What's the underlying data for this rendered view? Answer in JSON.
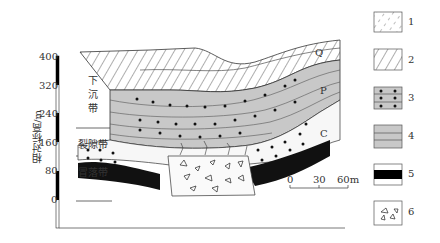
{
  "axis": {
    "label": "相对标高/m",
    "ticks": [
      "400",
      "320",
      "240",
      "160",
      "80",
      "0"
    ]
  },
  "zones": {
    "subsidence": "下沉带",
    "subsidence_chars": [
      "下",
      "沉",
      "带"
    ],
    "fracture": "裂隙带",
    "caving": "冒落带"
  },
  "strata_labels": {
    "q": "Q",
    "p": "P",
    "c": "C"
  },
  "scale_bar": {
    "ticks": [
      "0",
      "30",
      "60m"
    ]
  },
  "legend": [
    {
      "id": "1",
      "pattern": "dashed-hatch"
    },
    {
      "id": "2",
      "pattern": "diagonal-hatch"
    },
    {
      "id": "3",
      "pattern": "dotted-sandstone"
    },
    {
      "id": "4",
      "pattern": "dashed-mudstone"
    },
    {
      "id": "5",
      "pattern": "coal-seam-black"
    },
    {
      "id": "6",
      "pattern": "broken-rock-fragments"
    }
  ],
  "colors": {
    "gray_fill": "#c8c8c8",
    "coal": "#111111",
    "line": "#333333"
  }
}
